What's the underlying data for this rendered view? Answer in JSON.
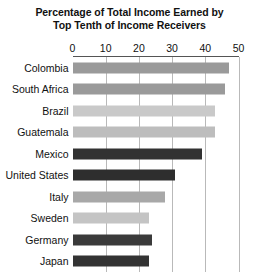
{
  "chart_data": {
    "type": "bar",
    "orientation": "horizontal",
    "title": "Percentage of Total Income Earned by Top Tenth of Income Receivers",
    "title_lines": [
      "Percentage of Total Income Earned by",
      "Top Tenth of Income Receivers"
    ],
    "xlabel": "",
    "ylabel": "",
    "xlim": [
      0,
      50
    ],
    "xticks": [
      0,
      10,
      20,
      30,
      40,
      50
    ],
    "xtick_labels": [
      "0",
      "10",
      "20",
      "30",
      "40",
      "50"
    ],
    "grid": true,
    "grid_axis": "x",
    "legend": false,
    "axis_position": "top",
    "categories": [
      "Colombia",
      "South Africa",
      "Brazil",
      "Guatemala",
      "Mexico",
      "United States",
      "Italy",
      "Sweden",
      "Germany",
      "Japan"
    ],
    "values": [
      47,
      46,
      43,
      43,
      39,
      31,
      28,
      23,
      24,
      23
    ],
    "bar_colors": [
      "#9a9a9a",
      "#9a9a9a",
      "#c9c9c9",
      "#bdbdbd",
      "#323232",
      "#2e2e2e",
      "#a8a8a8",
      "#c4c4c4",
      "#3a3a3a",
      "#333333"
    ],
    "bars": [
      {
        "label": "Colombia",
        "value": 47,
        "color": "#9a9a9a"
      },
      {
        "label": "South Africa",
        "value": 46,
        "color": "#9a9a9a"
      },
      {
        "label": "Brazil",
        "value": 43,
        "color": "#c9c9c9"
      },
      {
        "label": "Guatemala",
        "value": 43,
        "color": "#bdbdbd"
      },
      {
        "label": "Mexico",
        "value": 39,
        "color": "#323232"
      },
      {
        "label": "United States",
        "value": 31,
        "color": "#2e2e2e"
      },
      {
        "label": "Italy",
        "value": 28,
        "color": "#a8a8a8"
      },
      {
        "label": "Sweden",
        "value": 23,
        "color": "#c4c4c4"
      },
      {
        "label": "Germany",
        "value": 24,
        "color": "#3a3a3a"
      },
      {
        "label": "Japan",
        "value": 23,
        "color": "#333333"
      }
    ]
  },
  "style": {
    "background": "#ffffff",
    "text_color": "#111111",
    "gridline_color": "#b9b9b9",
    "axis_rule_color": "#555555"
  }
}
